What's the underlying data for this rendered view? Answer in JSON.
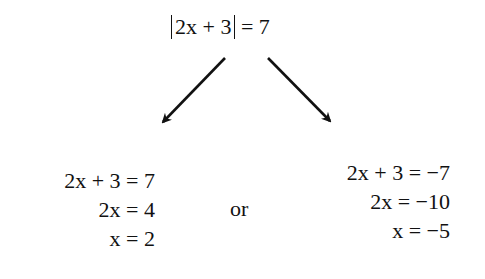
{
  "top_equation": {
    "abs_inner": "2x + 3",
    "rhs": " = 7"
  },
  "left_branch": {
    "lines": [
      "2x + 3 = 7",
      "2x = 4",
      "x = 2"
    ]
  },
  "connector": "or",
  "right_branch": {
    "lines": [
      "2x + 3 = −7",
      "2x = −10",
      "x = −5"
    ]
  },
  "arrows": [
    {
      "name": "left",
      "from": [
        225,
        58
      ],
      "to": [
        162,
        123
      ]
    },
    {
      "name": "right",
      "from": [
        268,
        58
      ],
      "to": [
        331,
        122
      ]
    }
  ],
  "colors": {
    "ink": "#111111",
    "background": "#ffffff"
  }
}
